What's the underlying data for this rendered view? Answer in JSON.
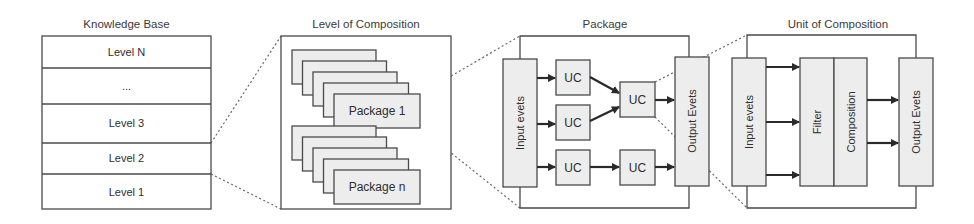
{
  "knowledge_base": {
    "title": "Knowledge Base",
    "levels": [
      "Level N",
      "...",
      "Level 3",
      "Level 2",
      "Level 1"
    ]
  },
  "level_of_composition": {
    "title": "Level of Composition",
    "packages": [
      "Package 1",
      "Package n"
    ]
  },
  "package": {
    "title": "Package",
    "input_label": "Input evets",
    "output_label": "Output Evets",
    "units": [
      "UC",
      "UC",
      "UC",
      "UC",
      "UC"
    ]
  },
  "unit_of_composition": {
    "title": "Unit of Composition",
    "input_label": "Input evets",
    "filter_label": "Filter",
    "composition_label": "Composition",
    "output_label": "Output Evets"
  },
  "colors": {
    "stroke": "#4a4a4a",
    "fill": "#ededed",
    "background": "#ffffff"
  }
}
